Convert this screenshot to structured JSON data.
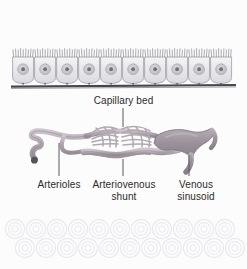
{
  "figure": {
    "background_color": "#fcfcfc",
    "text_color": "#2b2b2b"
  },
  "labels": {
    "capillary_bed": "Capillary bed",
    "arterioles": "Arterioles",
    "arteriovenous_shunt": "Arteriovenous\nshunt",
    "venous_sinusoid": "Venous\nsinusoid"
  },
  "structures": {
    "epithelium": {
      "name": "columnar epithelium with brush border",
      "cell_count": 10,
      "cell_fill": "#e9e9ec",
      "nucleus_fill": "#c9c9cf",
      "nucleolus_fill": "#6f6f78",
      "microvilli_color": "#9a9aa2",
      "basement_membrane_color": "#4a4a50"
    },
    "vessels": {
      "arteriole_color": "#b3aab3",
      "capillary_color": "#b0a7b0",
      "shunt_color": "#a99fa9",
      "sinusoid_color": "#9d939d",
      "outline_color": "#7e757e",
      "arteriole_tip_color": "#565059"
    },
    "ghost_cells": {
      "name": "faint background cell layer",
      "rows": 2,
      "color": "#eeeef1"
    },
    "leader_line_color": "#5a5a60"
  }
}
